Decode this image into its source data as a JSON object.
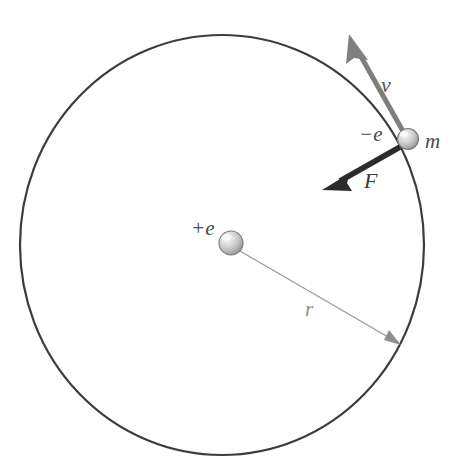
{
  "figure": {
    "background_color": "#ffffff",
    "labels": {
      "nucleus_charge": "+e",
      "electron_charge": "−e",
      "electron_mass": "m",
      "velocity": "v",
      "force": "F",
      "radius": "r"
    },
    "colors": {
      "orbit_stroke": "#3c3c3c",
      "velocity_arrow": "#7f7f7f",
      "force_arrow": "#2b2b2b",
      "radius_line": "#9a9a9a",
      "sphere_light": "#efefef",
      "sphere_mid": "#c8c8c8",
      "sphere_dark": "#8f8f8f",
      "sphere_edge": "#787878"
    },
    "geometry": {
      "orbit_center_x": 222,
      "orbit_center_y": 245,
      "orbit_radius_x": 202,
      "orbit_radius_y": 210,
      "orbit_stroke_width": 2.2,
      "nucleus_x": 231,
      "nucleus_y": 243,
      "nucleus_radius": 12,
      "electron_x": 408,
      "electron_y": 139,
      "electron_radius": 10.5,
      "velocity_tip_x": 350,
      "velocity_tip_y": 38,
      "force_tip_x": 325,
      "force_tip_y": 188,
      "radius_arrow_tip_x": 400,
      "radius_arrow_tip_y": 345
    },
    "label_positions": {
      "nucleus_charge": {
        "x": 191,
        "y": 218
      },
      "electron_charge": {
        "x": 359,
        "y": 124
      },
      "electron_mass": {
        "x": 425,
        "y": 131
      },
      "velocity": {
        "x": 381,
        "y": 74
      },
      "force": {
        "x": 364,
        "y": 170
      },
      "radius": {
        "x": 305,
        "y": 299
      }
    }
  }
}
